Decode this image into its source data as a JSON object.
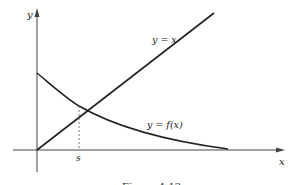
{
  "figure": {
    "caption": "Figure 4.12",
    "axes": {
      "x_label": "x",
      "y_label": "y"
    },
    "curves": [
      {
        "name": "identity-line",
        "label": "y = x",
        "description": "straight line through origin"
      },
      {
        "name": "f-curve",
        "label": "y = f(x)",
        "description": "decreasing curve starting on positive y-axis"
      }
    ],
    "intersection": {
      "label": "s",
      "description": "x-coordinate where y = x meets y = f(x); dashed vertical drop to x-axis"
    }
  },
  "colors": {
    "ink": "#222222",
    "background": "#ffffff"
  }
}
